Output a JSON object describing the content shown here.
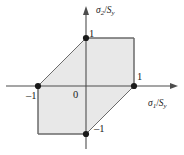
{
  "figure": {
    "name": "tresca-yield-hexagon",
    "background_color": "#ffffff"
  },
  "axes": {
    "x_label_sigma": "σ",
    "x_label_sub": "1",
    "x_label_denom": "S",
    "x_label_denom_sub": "y",
    "x_label_slash": "/",
    "y_label_sigma": "σ",
    "y_label_sub": "2",
    "y_label_denom": "S",
    "y_label_denom_sub": "y",
    "y_label_slash": "/"
  },
  "ticks": {
    "origin": "0",
    "x_pos_one": "1",
    "x_neg_one": "–1",
    "y_pos_one": "1",
    "y_neg_one": "–1"
  },
  "colors": {
    "fill": "#e8e8e8",
    "outline": "#6b6b6b",
    "axis": "#4d4d4d",
    "marker": "#1a1a1a",
    "text": "#1a1a1a"
  },
  "chart_data": {
    "type": "line",
    "title": "",
    "subtitle": "",
    "xlabel": "σ₁/Sᵧ",
    "ylabel": "σ₂/Sᵧ",
    "xlim": [
      -1.45,
      1.45
    ],
    "ylim": [
      -1.45,
      1.45
    ],
    "xticks": [
      -1,
      0,
      1
    ],
    "xticklabels": [
      "–1",
      "0",
      "1"
    ],
    "yticks": [
      -1,
      1
    ],
    "yticklabels": [
      "–1",
      "1"
    ],
    "grid": false,
    "legend": null,
    "series": [
      {
        "name": "Tresca (maximum shear stress) yield locus",
        "closed": true,
        "filled": true,
        "fill_color": "#e8e8e8",
        "line_color": "#6b6b6b",
        "x": [
          1,
          1,
          0,
          -1,
          -1,
          0
        ],
        "y": [
          0,
          1,
          1,
          0,
          -1,
          -1
        ]
      }
    ],
    "markers": [
      {
        "x": 0,
        "y": 1,
        "label": "1"
      },
      {
        "x": 1,
        "y": 0,
        "label": "1"
      },
      {
        "x": -1,
        "y": 0,
        "label": "–1"
      },
      {
        "x": 0,
        "y": -1,
        "label": "–1"
      }
    ],
    "annotations": []
  }
}
